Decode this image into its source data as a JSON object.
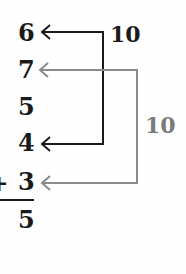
{
  "addends": [
    "6",
    "7",
    "5",
    "4",
    "3"
  ],
  "operator": "+",
  "sum": "5",
  "pairs": [
    {
      "label": "10",
      "links": [
        "6",
        "4"
      ],
      "color": "#1a1a1a"
    },
    {
      "label": "10",
      "links": [
        "7",
        "3"
      ],
      "color": "#7a7a7a"
    }
  ]
}
